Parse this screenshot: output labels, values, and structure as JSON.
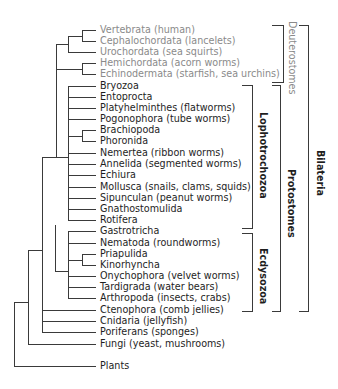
{
  "taxa": [
    {
      "label": "Vertebrata (human)",
      "group": "deuterostome"
    },
    {
      "label": "Cephalochordata (lancelets)",
      "group": "deuterostome"
    },
    {
      "label": "Urochordata (sea squirts)",
      "group": "deuterostome"
    },
    {
      "label": "Hemichordata (acorn worms)",
      "group": "deuterostome"
    },
    {
      "label": "Echinodermata (starfish, sea urchins)",
      "group": "deuterostome"
    },
    {
      "label": "Bryozoa",
      "group": "lophotrochozoa"
    },
    {
      "label": "Entoprocta",
      "group": "lophotrochozoa"
    },
    {
      "label": "Platyhelminthes (flatworms)",
      "group": "lophotrochozoa"
    },
    {
      "label": "Pogonophora (tube worms)",
      "group": "lophotrochozoa"
    },
    {
      "label": "Brachiopoda",
      "group": "lophotrochozoa"
    },
    {
      "label": "Phoronida",
      "group": "lophotrochozoa"
    },
    {
      "label": "Nemertea (ribbon worms)",
      "group": "lophotrochozoa"
    },
    {
      "label": "Annelida (segmented worms)",
      "group": "lophotrochozoa"
    },
    {
      "label": "Echiura",
      "group": "lophotrochozoa"
    },
    {
      "label": "Mollusca (snails, clams, squids)",
      "group": "lophotrochozoa"
    },
    {
      "label": "Sipunculan (peanut worms)",
      "group": "lophotrochozoa"
    },
    {
      "label": "Gnathostomulida",
      "group": "lophotrochozoa"
    },
    {
      "label": "Rotifera",
      "group": "lophotrochozoa"
    },
    {
      "label": "Gastrotricha",
      "group": "ecdysozoa"
    },
    {
      "label": "Nematoda (roundworms)",
      "group": "ecdysozoa"
    },
    {
      "label": "Priapulida",
      "group": "ecdysozoa"
    },
    {
      "label": "Kinorhyncha",
      "group": "ecdysozoa"
    },
    {
      "label": "Onychophora (velvet worms)",
      "group": "ecdysozoa"
    },
    {
      "label": "Tardigrada (water bears)",
      "group": "ecdysozoa"
    },
    {
      "label": "Arthropoda (insects, crabs)",
      "group": "ecdysozoa"
    },
    {
      "label": "Ctenophora (comb jellies)",
      "group": "basal"
    },
    {
      "label": "Cnidaria (jellyfish)",
      "group": "basal"
    },
    {
      "label": "Poriferans (sponges)",
      "group": "basal"
    },
    {
      "label": "Fungi (yeast, mushrooms)",
      "group": "outgroup"
    },
    {
      "label": "Plants",
      "group": "outgroup"
    }
  ],
  "brackets": {
    "deuterostomes": "Deuterostomes",
    "lophotrochozoa": "Lophotrochozoa",
    "ecdysozoa": "Ecdysozoa",
    "protostomes": "Protostomes",
    "bilateria": "Bilateria"
  },
  "colors": {
    "line": "#3a3a3a",
    "deuterostome_text": "#8a8a8a",
    "text": "#1e1e1e"
  }
}
